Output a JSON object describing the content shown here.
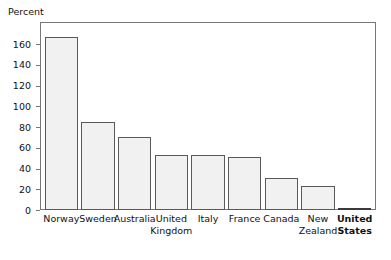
{
  "chart_data": {
    "type": "bar",
    "title": "",
    "subtitle": "",
    "xlabel": "",
    "ylabel": "Percent",
    "ylim": [
      0,
      175
    ],
    "yticks": [
      0,
      20,
      40,
      60,
      80,
      100,
      120,
      140,
      160
    ],
    "grid": false,
    "legend": null,
    "categories": [
      "Norway",
      "Sweden",
      "Australia",
      "United Kingdom",
      "Italy",
      "France",
      "Canada",
      "New Zealand",
      "United States"
    ],
    "values": [
      167,
      85,
      70,
      53,
      53,
      51,
      31,
      23,
      2
    ],
    "highlight_category": "United States",
    "bar_fill": "#f1f1f1",
    "bar_stroke": "#595959",
    "frame_stroke": "#777777",
    "text_color": "#111111"
  },
  "axis": {
    "y_title": "Percent",
    "tick_labels": [
      "160",
      "140",
      "120",
      "100",
      "80",
      "60",
      "40",
      "20",
      "0"
    ]
  },
  "bars": [
    {
      "label": "Norway",
      "value": 167,
      "bold": false
    },
    {
      "label": "Sweden",
      "value": 85,
      "bold": false
    },
    {
      "label": "Australia",
      "value": 70,
      "bold": false
    },
    {
      "label": "United Kingdom",
      "value": 53,
      "bold": false
    },
    {
      "label": "Italy",
      "value": 53,
      "bold": false
    },
    {
      "label": "France",
      "value": 51,
      "bold": false
    },
    {
      "label": "Canada",
      "value": 31,
      "bold": false
    },
    {
      "label": "New Zealand",
      "value": 23,
      "bold": false
    },
    {
      "label": "United States",
      "value": 2,
      "bold": true
    }
  ]
}
